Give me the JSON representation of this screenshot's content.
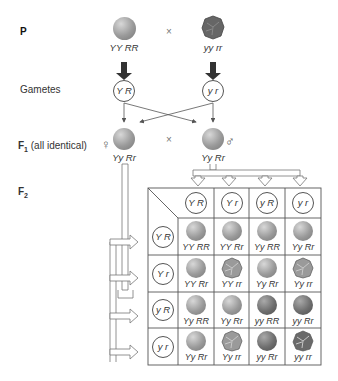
{
  "labels": {
    "p": "P",
    "gametes": "Gametes",
    "f1": "F",
    "f1_sub": "1",
    "f1_note": " (all identical)",
    "f2": "F",
    "f2_sub": "2",
    "cross": "×",
    "female": "♀",
    "male": "♂"
  },
  "parents": {
    "left": {
      "genotype": "YY RR",
      "phenotype": "yellow-round"
    },
    "right": {
      "genotype": "yy rr",
      "phenotype": "green-wrinkled"
    }
  },
  "gametes": {
    "left": "Y R",
    "right": "y r"
  },
  "f1": {
    "left": {
      "genotype": "Yy Rr"
    },
    "right": {
      "genotype": "Yy Rr"
    }
  },
  "punnett": {
    "col_headers": [
      "Y R",
      "Y r",
      "y R",
      "y r"
    ],
    "row_headers": [
      "Y R",
      "Y r",
      "y R",
      "y r"
    ],
    "rows": [
      [
        {
          "g": "YY RR",
          "p": "yr"
        },
        {
          "g": "YY Rr",
          "p": "yr"
        },
        {
          "g": "Yy RR",
          "p": "yr"
        },
        {
          "g": "Yy Rr",
          "p": "yr"
        }
      ],
      [
        {
          "g": "YY Rr",
          "p": "yr"
        },
        {
          "g": "YY rr",
          "p": "yw"
        },
        {
          "g": "Yy Rr",
          "p": "yr"
        },
        {
          "g": "Yy rr",
          "p": "yw"
        }
      ],
      [
        {
          "g": "Yy RR",
          "p": "yr"
        },
        {
          "g": "Yy Rr",
          "p": "yr"
        },
        {
          "g": "yy RR",
          "p": "gr"
        },
        {
          "g": "yy Rr",
          "p": "gr"
        }
      ],
      [
        {
          "g": "Yy Rr",
          "p": "yr"
        },
        {
          "g": "Yy rr",
          "p": "yw"
        },
        {
          "g": "yy Rr",
          "p": "gr"
        },
        {
          "g": "yy rr",
          "p": "gw"
        }
      ]
    ]
  },
  "colors": {
    "yellow_round": "#9a9a9a",
    "green": "#6e6e6e",
    "grid": "#555555"
  }
}
